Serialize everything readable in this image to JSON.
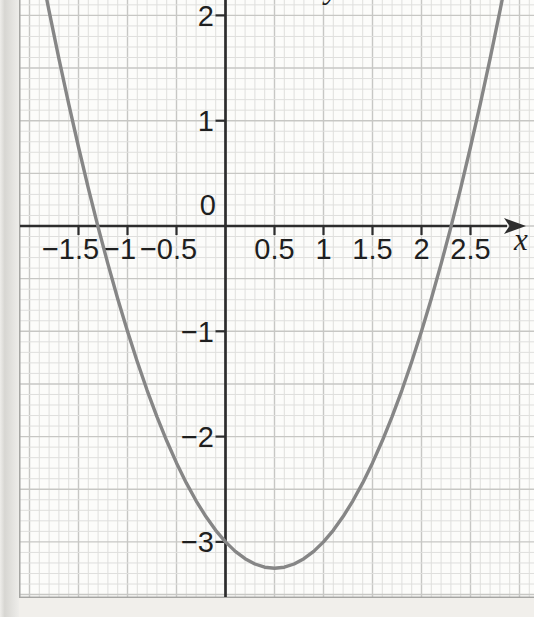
{
  "chart_data": {
    "type": "line",
    "title": "",
    "xlabel": "x",
    "ylabel": "y",
    "x_axis": {
      "label": "x",
      "ticks": [
        {
          "v": -1.5,
          "label": "−1.5"
        },
        {
          "v": -1.0,
          "label": "−1"
        },
        {
          "v": -0.5,
          "label": "−0.5"
        },
        {
          "v": 0.5,
          "label": "0.5"
        },
        {
          "v": 1.0,
          "label": "1"
        },
        {
          "v": 1.5,
          "label": "1.5"
        },
        {
          "v": 2.0,
          "label": "2"
        },
        {
          "v": 2.5,
          "label": "2.5"
        }
      ]
    },
    "y_axis": {
      "label": "y",
      "ticks": [
        {
          "v": 2,
          "label": "2"
        },
        {
          "v": 1,
          "label": "1"
        },
        {
          "v": -1,
          "label": "−1"
        },
        {
          "v": -2,
          "label": "−2"
        },
        {
          "v": -3,
          "label": "−3"
        }
      ]
    },
    "origin_label": "0",
    "grid": {
      "minor_step": 0.1,
      "major_step": 0.5,
      "visible": true
    },
    "x_range_visible": [
      -2.1,
      3.15
    ],
    "y_range_visible": [
      -3.55,
      2.15
    ],
    "series": [
      {
        "name": "parabola",
        "points": [
          [
            -1.9,
            2.51
          ],
          [
            -1.8,
            2.04
          ],
          [
            -1.7,
            1.59
          ],
          [
            -1.6,
            1.16
          ],
          [
            -1.5,
            0.75
          ],
          [
            -1.4,
            0.36
          ],
          [
            -1.3,
            -0.01
          ],
          [
            -1.2,
            -0.36
          ],
          [
            -1.1,
            -0.69
          ],
          [
            -1,
            -1
          ],
          [
            -0.9,
            -1.29
          ],
          [
            -0.8,
            -1.56
          ],
          [
            -0.7,
            -1.81
          ],
          [
            -0.6,
            -2.04
          ],
          [
            -0.5,
            -2.25
          ],
          [
            -0.4,
            -2.44
          ],
          [
            -0.3,
            -2.61
          ],
          [
            -0.2,
            -2.76
          ],
          [
            -0.1,
            -2.89
          ],
          [
            0,
            -3
          ],
          [
            0.1,
            -3.09
          ],
          [
            0.2,
            -3.16
          ],
          [
            0.3,
            -3.21
          ],
          [
            0.4,
            -3.24
          ],
          [
            0.5,
            -3.25
          ],
          [
            0.6,
            -3.24
          ],
          [
            0.7,
            -3.21
          ],
          [
            0.8,
            -3.16
          ],
          [
            0.9,
            -3.09
          ],
          [
            1,
            -3
          ],
          [
            1.1,
            -2.89
          ],
          [
            1.2,
            -2.76
          ],
          [
            1.3,
            -2.61
          ],
          [
            1.4,
            -2.44
          ],
          [
            1.5,
            -2.25
          ],
          [
            1.6,
            -2.04
          ],
          [
            1.7,
            -1.81
          ],
          [
            1.8,
            -1.56
          ],
          [
            1.9,
            -1.29
          ],
          [
            2,
            -1
          ],
          [
            2.1,
            -0.69
          ],
          [
            2.2,
            -0.36
          ],
          [
            2.3,
            -0.01
          ],
          [
            2.4,
            0.36
          ],
          [
            2.5,
            0.75
          ],
          [
            2.6,
            1.16
          ],
          [
            2.7,
            1.59
          ],
          [
            2.8,
            2.04
          ],
          [
            2.9,
            2.51
          ]
        ]
      }
    ],
    "features": {
      "x_intercepts": [
        -1.3,
        2.3
      ],
      "y_intercept": -3,
      "vertex": [
        0.5,
        -3.25
      ]
    },
    "legend": "none"
  },
  "colors": {
    "page_background": "#f1efeb",
    "page_edge_dark": "#d7d6d2",
    "page_edge_light": "#eeedea",
    "paper": "#fcfcfa",
    "grid_minor": "#dfdfdd",
    "grid_major": "#c7c7c4",
    "paper_border": "#a6a6a3",
    "axis": "#2d2d2d",
    "curve": "#868686",
    "label": "#1f1f1f"
  }
}
